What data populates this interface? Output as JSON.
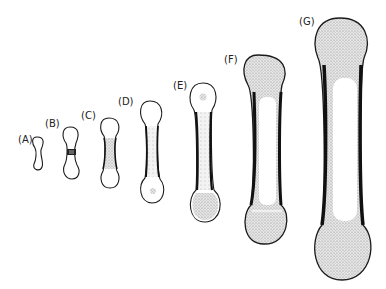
{
  "diagram": {
    "stages": [
      {
        "label": "(A)",
        "x": 18,
        "y": 137
      },
      {
        "label": "(B)",
        "x": 45,
        "y": 121
      },
      {
        "label": "(C)",
        "x": 81,
        "y": 114
      },
      {
        "label": "(D)",
        "x": 118,
        "y": 96
      },
      {
        "label": "(E)",
        "x": 173,
        "y": 83
      },
      {
        "label": "(F)",
        "x": 224,
        "y": 57
      },
      {
        "label": "(G)",
        "x": 299,
        "y": 17
      }
    ],
    "colors": {
      "outline": "#1a1a1a",
      "stipple": "#b8b8b8",
      "background": "#ffffff"
    }
  }
}
